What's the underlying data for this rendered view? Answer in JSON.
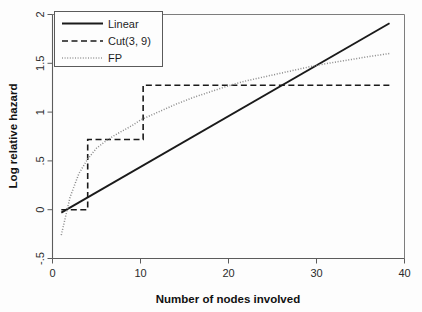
{
  "chart_data": {
    "type": "line",
    "title": "",
    "xlabel": "Number of nodes involved",
    "ylabel": "Log relative hazard",
    "xlim": [
      0,
      40
    ],
    "ylim": [
      -0.5,
      2
    ],
    "xticks": [
      0,
      10,
      20,
      30,
      40
    ],
    "xtick_labels": [
      "0",
      "10",
      "20",
      "30",
      "40"
    ],
    "yticks": [
      -0.5,
      0,
      0.5,
      1,
      1.5,
      2
    ],
    "ytick_labels": [
      "-.5",
      "0",
      ".5",
      "1",
      "1.5",
      "2"
    ],
    "grid": false,
    "legend_position": "top-left",
    "series": [
      {
        "name": "Linear",
        "style": "solid",
        "color": "#1a1a1a",
        "x": [
          1,
          38.3
        ],
        "y": [
          -0.03,
          1.91
        ]
      },
      {
        "name": "Cut(3, 9)",
        "style": "dashed",
        "color": "#1a1a1a",
        "step_cuts": [
          3,
          9
        ],
        "x": [
          1,
          4.0,
          4.0,
          10.3,
          10.3,
          38.3
        ],
        "y": [
          0.0,
          0.0,
          0.72,
          0.72,
          1.275,
          1.275
        ]
      },
      {
        "name": "FP",
        "style": "dotted",
        "color": "#8a8a8a",
        "x": [
          1,
          2,
          3,
          4,
          5,
          6,
          7,
          8,
          9,
          10,
          12,
          14,
          16,
          18,
          20,
          22,
          24,
          26,
          28,
          30,
          32,
          34,
          36,
          38.3
        ],
        "y": [
          -0.26,
          0.13,
          0.37,
          0.52,
          0.63,
          0.7,
          0.76,
          0.81,
          0.86,
          0.92,
          1.0,
          1.08,
          1.15,
          1.21,
          1.27,
          1.32,
          1.36,
          1.4,
          1.44,
          1.48,
          1.51,
          1.54,
          1.57,
          1.6
        ]
      }
    ]
  },
  "legend": {
    "entries": [
      {
        "label": "Linear"
      },
      {
        "label": "Cut(3, 9)"
      },
      {
        "label": "FP"
      }
    ]
  }
}
